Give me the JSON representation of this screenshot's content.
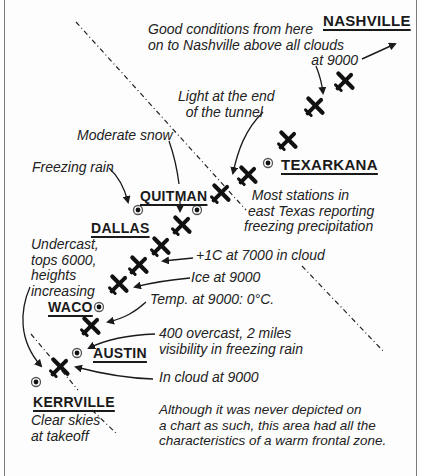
{
  "diagram": {
    "cities": [
      {
        "id": "nashville",
        "label": "NASHVILLE",
        "x": 323,
        "y": 12
      },
      {
        "id": "texarkana",
        "label": "TEXARKANA",
        "x": 281,
        "y": 156
      },
      {
        "id": "quitman",
        "label": "QUITMAN",
        "x": 140,
        "y": 188
      },
      {
        "id": "dallas",
        "label": "DALLAS",
        "x": 91,
        "y": 220
      },
      {
        "id": "waco",
        "label": "WACO",
        "x": 48,
        "y": 299
      },
      {
        "id": "austin",
        "label": "AUSTIN",
        "x": 93,
        "y": 345
      },
      {
        "id": "kerrville",
        "label": "KERRVILLE",
        "x": 33,
        "y": 387
      }
    ],
    "station_markers": [
      {
        "city": "texarkana",
        "x": 268,
        "y": 163
      },
      {
        "city": "quitman-left",
        "x": 138,
        "y": 210
      },
      {
        "city": "quitman-right",
        "x": 197,
        "y": 210
      },
      {
        "city": "waco",
        "x": 99,
        "y": 307
      },
      {
        "city": "austin",
        "x": 77,
        "y": 353
      },
      {
        "city": "kerrville",
        "x": 36,
        "y": 382
      }
    ],
    "notes": {
      "good_conditions": "Good conditions from here\non to Nashville above all clouds\n                                          at 9000",
      "light_tunnel": "Light at the end\n  of the tunnel",
      "moderate_snow": "Moderate snow",
      "freezing_rain": "Freezing rain",
      "most_stations": "  Most stations in\n east Texas reporting\nfreezing precipitation",
      "undercast": "Undercast,\ntops 6000,\nheights\nincreasing",
      "plus1c": "+1C at 7000 in cloud",
      "ice": "Ice at 9000",
      "temp": "Temp. at 9000: 0°C.",
      "overcast400": "400 overcast, 2 miles\nvisibility in freezing rain",
      "in_cloud": "In cloud at 9000",
      "clear_skies": "Clear skies\nat takeoff",
      "warm_front": "Although it was never depicted on\na chart as such, this area had all the\ncharacteristics of a warm frontal zone."
    },
    "flight_path": {
      "aircraft_icon": "airplane-icon",
      "positions": [
        [
          59,
          368
        ],
        [
          90,
          327
        ],
        [
          118,
          285
        ],
        [
          138,
          267
        ],
        [
          160,
          248
        ],
        [
          180,
          227
        ],
        [
          220,
          195
        ],
        [
          247,
          177
        ],
        [
          287,
          142
        ],
        [
          314,
          108
        ],
        [
          344,
          83
        ],
        [
          365,
          68
        ]
      ]
    },
    "frontal_zone_boundary": "warm-front-dash-dot-lines",
    "colors": {
      "ink": "#1a1a1a",
      "background": "#fdfdfd",
      "frame": "#7a7a7a"
    }
  }
}
